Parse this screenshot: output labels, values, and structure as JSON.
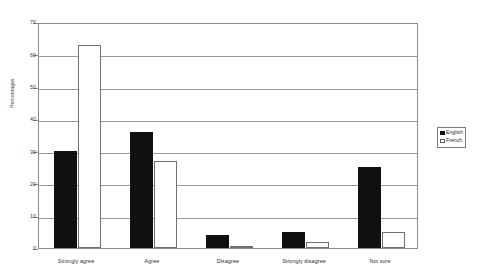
{
  "chart_data": {
    "type": "bar",
    "title": "",
    "subtitle": "",
    "xlabel": "",
    "ylabel": "Percentages",
    "ylim": [
      0,
      70
    ],
    "ytick_labels": [
      "0",
      "10",
      "20",
      "30",
      "40",
      "50",
      "60",
      "70"
    ],
    "ytick_values": [
      0,
      10,
      20,
      30,
      40,
      50,
      60,
      70
    ],
    "grid": true,
    "grid_axis": "y",
    "legend_position": "right",
    "categories": [
      "Strongly agree",
      "Agree",
      "Disagree",
      "Strongly disagree",
      "Not sure"
    ],
    "series": [
      {
        "name": "English",
        "color": "#101010",
        "fill": "solid",
        "values": [
          30,
          36,
          4,
          5,
          25
        ]
      },
      {
        "name": "French",
        "color": "#ffffff",
        "fill": "open",
        "values": [
          63,
          27,
          0.5,
          2,
          5
        ]
      }
    ]
  },
  "legend": {
    "entries": [
      {
        "label": "English",
        "swatch": "filled-square-icon"
      },
      {
        "label": "French",
        "swatch": "open-square-icon"
      }
    ]
  },
  "axes": {
    "y_title": "Percentages"
  }
}
